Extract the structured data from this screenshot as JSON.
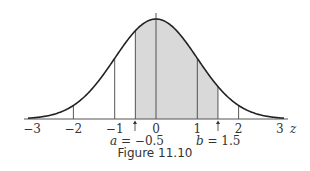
{
  "caption": "Figure 11.10",
  "chart_data": {
    "type": "area",
    "xlabel": "z",
    "ylabel": "",
    "xlim": [
      -3,
      3
    ],
    "x_ticks": [
      -3,
      -2,
      -1,
      0,
      1,
      2,
      3
    ],
    "x_tick_labels": [
      "−3",
      "−2",
      "−1",
      "0",
      "1",
      "2",
      "3"
    ],
    "grid": false,
    "curve": "standard normal density",
    "vertical_lines_at": [
      -2,
      -1,
      -0.5,
      0,
      1,
      1.5,
      2
    ],
    "shaded_region": {
      "from": -0.5,
      "to": 1.5,
      "color": "#d9d9d9"
    },
    "annotations": [
      {
        "label": "a = −0.5",
        "at": -0.5,
        "arrow": true
      },
      {
        "label": "b = 1.5",
        "at": 1.5,
        "arrow": true
      }
    ]
  },
  "labels": {
    "z": "z",
    "a_var": "a",
    "a_val": " = −0.5",
    "b_var": "b",
    "b_val": " = 1.5"
  }
}
